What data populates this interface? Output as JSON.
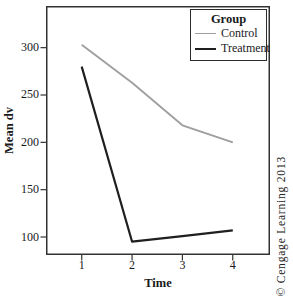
{
  "figure": {
    "background": "#ffffff",
    "border_color": "#333333",
    "tick_color": "#333333",
    "text_color": "#1a1a1a"
  },
  "chart_data": {
    "type": "line",
    "title": "",
    "xlabel": "Time",
    "ylabel": "Mean dv",
    "x": [
      1,
      2,
      3,
      4
    ],
    "x_ticks": [
      1,
      2,
      3,
      4
    ],
    "y_ticks": [
      100,
      150,
      200,
      250,
      300
    ],
    "xlim": [
      0.29,
      4.74
    ],
    "ylim": [
      81,
      344
    ],
    "grid": false,
    "markers": false,
    "legend": {
      "title": "Group",
      "position": "top-right"
    },
    "series": [
      {
        "name": "Control",
        "color": "#9e9e9e",
        "stroke_width": 1.8,
        "values": [
          303,
          263,
          218,
          200
        ]
      },
      {
        "name": "Treatment",
        "color": "#1f1f1f",
        "stroke_width": 2.2,
        "values": [
          280,
          95,
          101,
          107
        ]
      }
    ]
  },
  "watermark": {
    "text": "© Cengage Learning 2013"
  }
}
